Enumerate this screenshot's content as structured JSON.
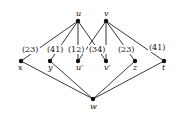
{
  "diagram": {
    "type": "graph",
    "nodes": [
      {
        "id": "u",
        "label": "u",
        "x": 78,
        "y": 21
      },
      {
        "id": "v",
        "label": "v",
        "x": 106,
        "y": 21
      },
      {
        "id": "x",
        "label": "x",
        "x": 21,
        "y": 61
      },
      {
        "id": "y",
        "label": "y",
        "x": 50,
        "y": 61
      },
      {
        "id": "u1",
        "label": "u′",
        "x": 78,
        "y": 61
      },
      {
        "id": "v1",
        "label": "v′",
        "x": 106,
        "y": 61
      },
      {
        "id": "z",
        "label": "z",
        "x": 135,
        "y": 61
      },
      {
        "id": "t",
        "label": "t",
        "x": 164,
        "y": 61
      },
      {
        "id": "w",
        "label": "w",
        "x": 93,
        "y": 99
      }
    ],
    "edges": [
      {
        "from": "u",
        "to": "x"
      },
      {
        "from": "u",
        "to": "y"
      },
      {
        "from": "u",
        "to": "u1"
      },
      {
        "from": "u",
        "to": "v1"
      },
      {
        "from": "v",
        "to": "u1"
      },
      {
        "from": "v",
        "to": "v1"
      },
      {
        "from": "v",
        "to": "z"
      },
      {
        "from": "v",
        "to": "t"
      },
      {
        "from": "x",
        "to": "w"
      },
      {
        "from": "y",
        "to": "w"
      },
      {
        "from": "z",
        "to": "w"
      },
      {
        "from": "t",
        "to": "w"
      }
    ],
    "weights": [
      {
        "text": "(23)",
        "x": 22,
        "y": 52
      },
      {
        "text": "(41)",
        "x": 47,
        "y": 52
      },
      {
        "text": "(12)",
        "x": 68,
        "y": 52
      },
      {
        "text": "(34)",
        "x": 89,
        "y": 52
      },
      {
        "text": "(23)",
        "x": 118,
        "y": 52
      },
      {
        "text": "(41)",
        "x": 149,
        "y": 50
      }
    ]
  }
}
